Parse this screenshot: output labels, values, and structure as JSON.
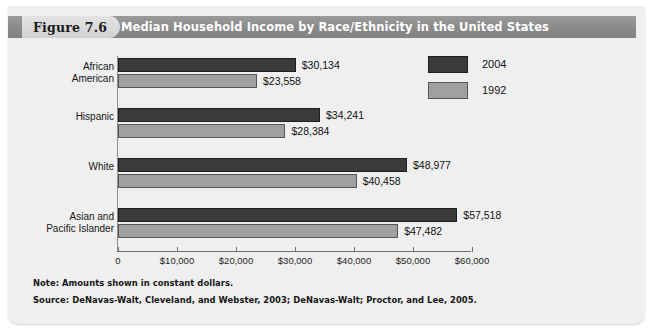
{
  "figure": {
    "number_label": "Figure 7.6",
    "title": "Median Household Income by Race/Ethnicity in the United States"
  },
  "notes": {
    "note": "Note: Amounts shown in constant dollars.",
    "source": "Source: DeNavas-Walt, Cleveland, and Webster, 2003; DeNavas-Walt; Proctor, and Lee, 2005."
  },
  "colors": {
    "series_2004": "#3b3b3b",
    "series_1992": "#a0a0a0",
    "header_bar": "#8d8d8d",
    "figure_tab": "#d9d9d9",
    "panel_background": "#efefef"
  },
  "chart_data": {
    "type": "bar",
    "orientation": "horizontal",
    "title": "Median Household Income by Race/Ethnicity in the United States",
    "xlabel": "",
    "ylabel": "",
    "xlim": [
      0,
      60000
    ],
    "grid": false,
    "legend_position": "top-right",
    "categories": [
      "African American",
      "Hispanic",
      "White",
      "Asian and Pacific Islander"
    ],
    "tick_labels": [
      "0",
      "$10,000",
      "$20,000",
      "$30,000",
      "$40,000",
      "$50,000",
      "$60,000"
    ],
    "tick_values": [
      0,
      10000,
      20000,
      30000,
      40000,
      50000,
      60000
    ],
    "series": [
      {
        "name": "2004",
        "color": "#3b3b3b",
        "values": [
          30134,
          34241,
          48977,
          57518
        ],
        "value_labels": [
          "$30,134",
          "$34,241",
          "$48,977",
          "$57,518"
        ]
      },
      {
        "name": "1992",
        "color": "#a0a0a0",
        "values": [
          23558,
          28384,
          40458,
          47482
        ],
        "value_labels": [
          "$23,558",
          "$28,384",
          "$40,458",
          "$47,482"
        ]
      }
    ]
  }
}
